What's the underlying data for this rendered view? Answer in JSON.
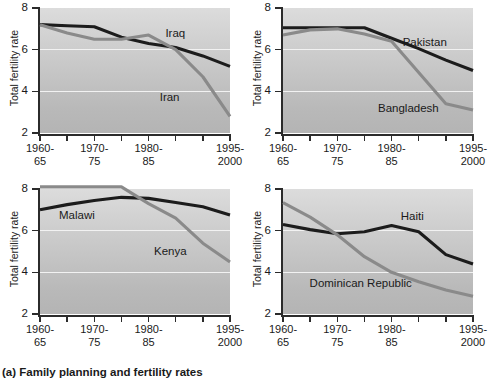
{
  "caption": "(a) Family planning and fertility rates",
  "axis": {
    "ylabel": "Total fertility rate",
    "yticks": [
      "8",
      "6",
      "4",
      "2"
    ],
    "xticklabels": [
      {
        "line1": "1960-",
        "line2": "65"
      },
      {
        "line1": "1970-",
        "line2": "75"
      },
      {
        "line1": "1980-",
        "line2": "85"
      },
      {
        "line1": "1995-",
        "line2": "2000"
      }
    ]
  },
  "colors": {
    "black_series": "#1c1c1c",
    "gray_series": "#8a8a8a",
    "gridline": "#f2f2f2",
    "plot_bg_top": "#dcdcdc",
    "plot_bg_bottom": "#b4b4b4",
    "axis": "#2b2b2b"
  },
  "chart_data": {
    "type": "line",
    "title": "(a) Family planning and fertility rates",
    "xlabel": "",
    "ylabel": "Total fertility rate",
    "ylim": [
      2,
      8
    ],
    "yticks": [
      2,
      4,
      6,
      8
    ],
    "grid": "horizontal-white-at-4-and-6",
    "legend": "inline-labels",
    "x": [
      "1960-65",
      "1965-70",
      "1970-75",
      "1975-80",
      "1980-85",
      "1985-90",
      "1990-95",
      "1995-2000"
    ],
    "xtick_labeled_indices": [
      0,
      2,
      4,
      7
    ],
    "panels": [
      {
        "id": "iraq-iran",
        "series": [
          {
            "name": "Iraq",
            "color": "#1c1c1c",
            "values": [
              7.2,
              7.15,
              7.1,
              6.6,
              6.3,
              6.1,
              5.7,
              5.2
            ]
          },
          {
            "name": "Iran",
            "color": "#8a8a8a",
            "values": [
              7.2,
              6.8,
              6.5,
              6.5,
              6.7,
              6.0,
              4.7,
              2.8
            ]
          }
        ],
        "labels": [
          {
            "name": "Iraq",
            "x_frac": 0.66,
            "y_value": 6.75
          },
          {
            "name": "Iran",
            "x_frac": 0.63,
            "y_value": 3.7
          }
        ]
      },
      {
        "id": "pakistan-bangladesh",
        "series": [
          {
            "name": "Pakistan",
            "color": "#1c1c1c",
            "values": [
              7.05,
              7.05,
              7.05,
              7.05,
              6.55,
              6.05,
              5.5,
              5.0
            ]
          },
          {
            "name": "Bangladesh",
            "color": "#8a8a8a",
            "values": [
              6.7,
              6.95,
              7.0,
              6.75,
              6.4,
              4.9,
              3.4,
              3.1
            ]
          }
        ],
        "labels": [
          {
            "name": "Pakistan",
            "x_frac": 0.63,
            "y_value": 6.3
          },
          {
            "name": "Bangladesh",
            "x_frac": 0.5,
            "y_value": 3.15
          }
        ]
      },
      {
        "id": "malawi-kenya",
        "series": [
          {
            "name": "Malawi",
            "color": "#1c1c1c",
            "values": [
              7.0,
              7.25,
              7.45,
              7.6,
              7.55,
              7.35,
              7.15,
              6.75
            ]
          },
          {
            "name": "Kenya",
            "color": "#8a8a8a",
            "values": [
              8.1,
              8.1,
              8.1,
              8.1,
              7.3,
              6.6,
              5.4,
              4.5
            ]
          }
        ],
        "labels": [
          {
            "name": "Malawi",
            "x_frac": 0.1,
            "y_value": 6.7
          },
          {
            "name": "Kenya",
            "x_frac": 0.6,
            "y_value": 5.0
          }
        ]
      },
      {
        "id": "haiti-dominican-republic",
        "series": [
          {
            "name": "Haiti",
            "color": "#1c1c1c",
            "values": [
              6.3,
              6.05,
              5.85,
              5.95,
              6.25,
              5.95,
              4.85,
              4.4
            ]
          },
          {
            "name": "Dominican Republic",
            "color": "#8a8a8a",
            "values": [
              7.35,
              6.65,
              5.8,
              4.75,
              4.0,
              3.55,
              3.15,
              2.85
            ]
          }
        ],
        "labels": [
          {
            "name": "Haiti",
            "x_frac": 0.62,
            "y_value": 6.65
          },
          {
            "name": "Dominican Republic",
            "x_frac": 0.14,
            "y_value": 3.45
          }
        ]
      }
    ]
  }
}
